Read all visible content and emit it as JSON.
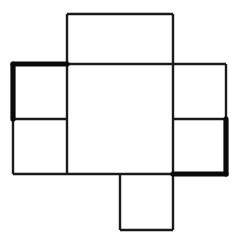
{
  "figure": {
    "background_color": "#ffffff",
    "stick_color": "#1a1a1a",
    "highlight_color": "#0a0a0a",
    "canvas": {
      "width": 239,
      "height": 249
    },
    "grid": {
      "x_positions": [
        13,
        67,
        120,
        173,
        226
      ],
      "y_positions": [
        14,
        64,
        119,
        174,
        230
      ],
      "unit": 54
    },
    "counts": {
      "total_sticks": 22,
      "highlighted_sticks": 4,
      "squares": 6
    },
    "sticks": [
      {
        "id": "h-top-mid-left",
        "x1": 67,
        "y1": 14,
        "x2": 120,
        "y2": 14,
        "weight": "normal"
      },
      {
        "id": "h-top-mid-right",
        "x1": 120,
        "y1": 14,
        "x2": 173,
        "y2": 14,
        "weight": "normal"
      },
      {
        "id": "v-topsq-left",
        "x1": 67,
        "y1": 14,
        "x2": 67,
        "y2": 64,
        "weight": "normal"
      },
      {
        "id": "v-topsq-right",
        "x1": 173,
        "y1": 14,
        "x2": 173,
        "y2": 64,
        "weight": "normal"
      },
      {
        "id": "h-row2-far-left",
        "x1": 13,
        "y1": 64,
        "x2": 67,
        "y2": 64,
        "weight": "bold"
      },
      {
        "id": "h-row2-left-center",
        "x1": 67,
        "y1": 64,
        "x2": 120,
        "y2": 64,
        "weight": "normal"
      },
      {
        "id": "h-row2-center-right",
        "x1": 120,
        "y1": 64,
        "x2": 173,
        "y2": 64,
        "weight": "normal"
      },
      {
        "id": "h-row2-far-right",
        "x1": 173,
        "y1": 64,
        "x2": 226,
        "y2": 64,
        "weight": "normal"
      },
      {
        "id": "v-col1-row2",
        "x1": 13,
        "y1": 64,
        "x2": 13,
        "y2": 119,
        "weight": "bold"
      },
      {
        "id": "v-col2-row2",
        "x1": 67,
        "y1": 64,
        "x2": 67,
        "y2": 119,
        "weight": "normal"
      },
      {
        "id": "v-col4-row2",
        "x1": 173,
        "y1": 64,
        "x2": 173,
        "y2": 119,
        "weight": "normal"
      },
      {
        "id": "v-col5-row2",
        "x1": 226,
        "y1": 64,
        "x2": 226,
        "y2": 119,
        "weight": "normal"
      },
      {
        "id": "h-row3-far-left",
        "x1": 13,
        "y1": 119,
        "x2": 67,
        "y2": 119,
        "weight": "normal"
      },
      {
        "id": "h-row3-far-right",
        "x1": 173,
        "y1": 119,
        "x2": 226,
        "y2": 119,
        "weight": "normal"
      },
      {
        "id": "v-col1-row3",
        "x1": 13,
        "y1": 119,
        "x2": 13,
        "y2": 174,
        "weight": "normal"
      },
      {
        "id": "v-col2-row3",
        "x1": 67,
        "y1": 119,
        "x2": 67,
        "y2": 174,
        "weight": "normal"
      },
      {
        "id": "v-col4-row3",
        "x1": 173,
        "y1": 119,
        "x2": 173,
        "y2": 174,
        "weight": "normal"
      },
      {
        "id": "v-col5-row3",
        "x1": 226,
        "y1": 119,
        "x2": 226,
        "y2": 174,
        "weight": "bold"
      },
      {
        "id": "h-row4-far-left",
        "x1": 13,
        "y1": 174,
        "x2": 67,
        "y2": 174,
        "weight": "normal"
      },
      {
        "id": "h-row4-left-center",
        "x1": 67,
        "y1": 174,
        "x2": 120,
        "y2": 174,
        "weight": "normal"
      },
      {
        "id": "h-row4-center-right",
        "x1": 120,
        "y1": 174,
        "x2": 173,
        "y2": 174,
        "weight": "normal"
      },
      {
        "id": "h-row4-far-right",
        "x1": 173,
        "y1": 174,
        "x2": 226,
        "y2": 174,
        "weight": "bold"
      },
      {
        "id": "v-botsq-left",
        "x1": 120,
        "y1": 174,
        "x2": 120,
        "y2": 230,
        "weight": "normal"
      },
      {
        "id": "v-botsq-right",
        "x1": 173,
        "y1": 174,
        "x2": 173,
        "y2": 230,
        "weight": "normal"
      },
      {
        "id": "h-bottom-mid",
        "x1": 120,
        "y1": 230,
        "x2": 173,
        "y2": 230,
        "weight": "normal"
      }
    ],
    "squares": [
      {
        "id": "square-top",
        "x": 67,
        "y": 14,
        "w": 106,
        "h": 50
      },
      {
        "id": "square-upper-left",
        "x": 13,
        "y": 64,
        "w": 54,
        "h": 55
      },
      {
        "id": "square-lower-left",
        "x": 13,
        "y": 119,
        "w": 54,
        "h": 55
      },
      {
        "id": "square-center",
        "x": 67,
        "y": 64,
        "w": 106,
        "h": 110
      },
      {
        "id": "square-upper-right",
        "x": 173,
        "y": 64,
        "w": 53,
        "h": 55
      },
      {
        "id": "square-lower-right",
        "x": 173,
        "y": 119,
        "w": 53,
        "h": 55
      },
      {
        "id": "square-bottom",
        "x": 120,
        "y": 174,
        "w": 53,
        "h": 56
      }
    ]
  }
}
